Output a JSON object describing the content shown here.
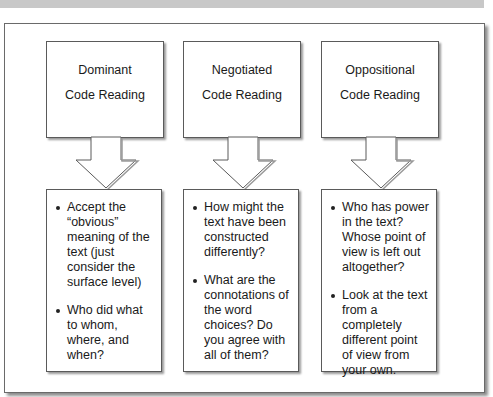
{
  "diagram": {
    "columns": [
      {
        "title_line1": "Dominant",
        "title_line2": "Code Reading",
        "bullets": [
          "Accept the “obvious” meaning of the text (just consider the surface level)",
          "Who did what to whom, where, and when?"
        ]
      },
      {
        "title_line1": "Negotiated",
        "title_line2": "Code Reading",
        "bullets": [
          "How might the text have been constructed differently?",
          "What are the connotations of the word choices? Do you agree with all of them?"
        ]
      },
      {
        "title_line1": "Oppositional",
        "title_line2": "Code Reading",
        "bullets": [
          "Who has power in the text?  Whose point of view is left out altogether?",
          "Look at the text from a completely different point of view from your own."
        ]
      }
    ],
    "colors": {
      "frame_border": "#6a6a6a",
      "shadow": "#8c8c8c",
      "top_band": "#c8c8c8"
    }
  }
}
